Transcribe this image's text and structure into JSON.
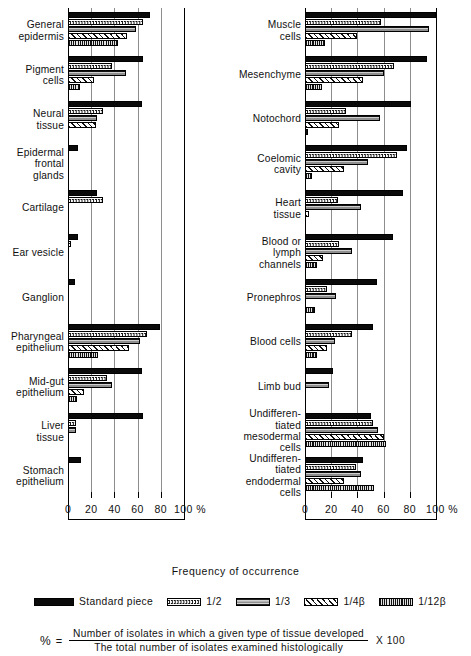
{
  "figure": {
    "axis_title": "Frequency of occurrence",
    "tick_labels": [
      "0",
      "20",
      "40",
      "60",
      "80",
      "100 %"
    ],
    "tick_values": [
      0,
      20,
      40,
      60,
      80,
      100
    ],
    "axis_max": 100,
    "header_strip": ""
  },
  "legend": {
    "items": [
      {
        "label": "Standard piece",
        "pattern": "solid",
        "key": "standard"
      },
      {
        "label": "1/2",
        "pattern": "dot",
        "key": "half"
      },
      {
        "label": "1/3",
        "pattern": "gray",
        "key": "third"
      },
      {
        "label": "1/4β",
        "pattern": "hatch",
        "key": "quarter_beta"
      },
      {
        "label": "1/12β",
        "pattern": "vert",
        "key": "twelfth_beta"
      }
    ]
  },
  "formula": {
    "percent_symbol": "%",
    "equals": "=",
    "numerator": "Number of isolates in which a given type of tissue developed",
    "denominator": "The total number of isolates examined histologically",
    "multiplier": "X 100"
  },
  "chart_data": {
    "type": "bar",
    "orientation": "horizontal",
    "title": "",
    "xlabel": "Frequency of occurrence",
    "ylabel": "",
    "xlim": [
      0,
      100
    ],
    "xticks": [
      0,
      20,
      40,
      60,
      80,
      100
    ],
    "grid": "vertical gridlines at 20, 40, 60, 80",
    "legend_position": "below plot",
    "series": [
      {
        "name": "Standard piece",
        "pattern": "solid"
      },
      {
        "name": "1/2",
        "pattern": "dot"
      },
      {
        "name": "1/3",
        "pattern": "gray"
      },
      {
        "name": "1/4β",
        "pattern": "hatch"
      },
      {
        "name": "1/12β",
        "pattern": "vert"
      }
    ],
    "panels": [
      {
        "panel": "left",
        "categories": [
          {
            "label": "General\nepidermis",
            "values": [
              71,
              65,
              59,
              51,
              43
            ]
          },
          {
            "label": "Pigment\ncells",
            "values": [
              65,
              38,
              50,
              22,
              10
            ]
          },
          {
            "label": "Neural\ntissue",
            "values": [
              64,
              30,
              25,
              24,
              0
            ]
          },
          {
            "label": "Epidermal\nfrontal\nglands",
            "values": [
              9,
              0,
              0,
              0,
              0
            ]
          },
          {
            "label": "Cartilage",
            "values": [
              25,
              30,
              0,
              0,
              0
            ]
          },
          {
            "label": "Ear vesicle",
            "values": [
              9,
              3,
              0,
              0,
              0
            ]
          },
          {
            "label": "Ganglion",
            "values": [
              6,
              0,
              0,
              0,
              0
            ]
          },
          {
            "label": "Pharyngeal\nepithelium",
            "values": [
              79,
              68,
              62,
              53,
              26
            ]
          },
          {
            "label": "Mid-gut\nepithelium",
            "values": [
              64,
              34,
              38,
              14,
              8
            ]
          },
          {
            "label": "Liver\ntissue",
            "values": [
              65,
              7,
              7,
              0,
              0
            ]
          },
          {
            "label": "Stomach\nepithelium",
            "values": [
              11,
              0,
              0,
              0,
              0
            ]
          }
        ]
      },
      {
        "panel": "right",
        "categories": [
          {
            "label": "Muscle\ncells",
            "values": [
              100,
              58,
              95,
              40,
              15
            ]
          },
          {
            "label": "Mesenchyme",
            "values": [
              93,
              68,
              60,
              44,
              13
            ]
          },
          {
            "label": "Notochord",
            "values": [
              81,
              31,
              57,
              26,
              2
            ]
          },
          {
            "label": "Coelomic\ncavity",
            "values": [
              78,
              70,
              48,
              30,
              5
            ]
          },
          {
            "label": "Heart\ntissue",
            "values": [
              75,
              25,
              43,
              3,
              0
            ]
          },
          {
            "label": "Blood or\nlymph\nchannels",
            "values": [
              67,
              26,
              36,
              14,
              9
            ]
          },
          {
            "label": "Pronephros",
            "values": [
              55,
              17,
              24,
              0,
              8
            ]
          },
          {
            "label": "Blood cells",
            "values": [
              52,
              36,
              23,
              17,
              9
            ]
          },
          {
            "label": "Limb bud",
            "values": [
              21,
              0,
              18,
              0,
              0
            ]
          },
          {
            "label": "Undifferen-\ntiated\nmesodermal\ncells",
            "values": [
              50,
              52,
              56,
              60,
              62
            ]
          },
          {
            "label": "Undifferen-\ntiated\nendodermal\ncells",
            "values": [
              44,
              39,
              43,
              30,
              53
            ]
          }
        ]
      }
    ]
  }
}
